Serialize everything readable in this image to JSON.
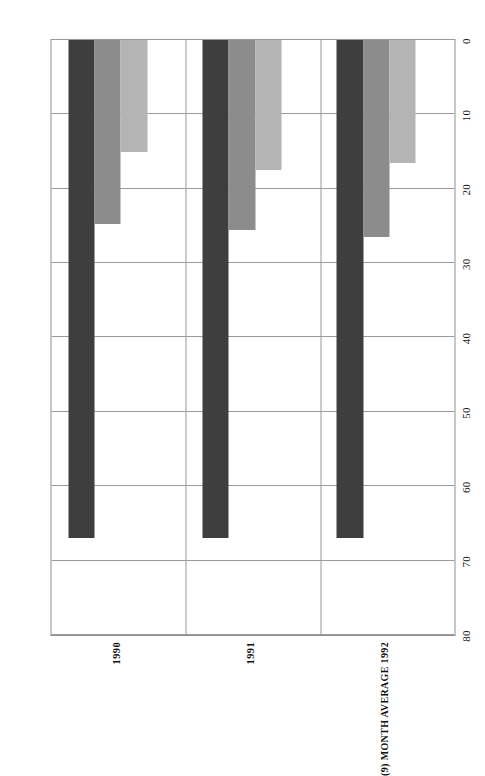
{
  "chart_data": {
    "type": "bar",
    "orientation": "horizontal",
    "title": "",
    "subtitle": "",
    "xlabel": "",
    "ylabel": "",
    "categories": [
      "1990",
      "1991",
      "(9) MONTH AVERAGE 1992"
    ],
    "series": [
      {
        "name": "series-1",
        "color": "#3e3e3e",
        "values": [
          67,
          67,
          67
        ]
      },
      {
        "name": "series-2",
        "color": "#8c8c8c",
        "values": [
          24.7,
          25.5,
          26.5
        ]
      },
      {
        "name": "series-3",
        "color": "#b4b4b4",
        "values": [
          15,
          17.5,
          16.5
        ]
      }
    ],
    "value_axis": {
      "ticks": [
        "0",
        "10",
        "20",
        "30",
        "40",
        "50",
        "60",
        "70",
        "80"
      ],
      "tick_values": [
        0,
        10,
        20,
        30,
        40,
        50,
        60,
        70,
        80
      ],
      "min": 0,
      "max": 80,
      "direction": "right-to-left"
    },
    "grid": {
      "vertical": true,
      "horizontal": true
    },
    "legend": {
      "visible": false,
      "position": "none"
    },
    "page_rotation_degrees": 90
  },
  "colors": {
    "series_dark": "#3e3e3e",
    "series_mid": "#8c8c8c",
    "series_light": "#b4b4b4",
    "grid": "#9a9a9a",
    "frame": "#8e8e8e",
    "background": "#ffffff",
    "text": "#141414"
  }
}
